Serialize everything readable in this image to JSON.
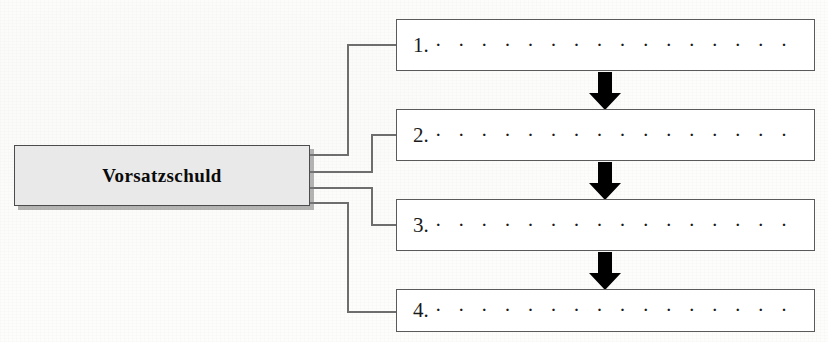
{
  "page": {
    "cropped_header_remnant": "g",
    "width": 828,
    "height": 342,
    "background_color": "#fdfdfc"
  },
  "diagram": {
    "type": "flowchart",
    "orientation": "left-to-right with vertical sequence",
    "source_node": {
      "label": "Vorsatzschuld",
      "fill_color": "#e9e9e9",
      "border_color": "#4c4c4c",
      "text_color": "#0a0a0a",
      "has_drop_shadow": true
    },
    "items": [
      {
        "number": "1.",
        "dots": "· · · · · · · · · · · · · · · · · · · · · · · · · · · · · · ·",
        "text": ""
      },
      {
        "number": "2.",
        "dots": "· · · · · · · · · · · · · · · · · · · · · · · · · · · · · · ·",
        "text": ""
      },
      {
        "number": "3.",
        "dots": "· · · · · · · · · · · · · · · · · · · · · · · · · · · · · · ·",
        "text": ""
      },
      {
        "number": "4.",
        "dots": "· · · · · · · · · · · · · · · · · · · · · · · · · · · · · · ·",
        "text": ""
      }
    ],
    "arrows": [
      {
        "name": "arrow-1-to-2",
        "direction": "down",
        "color": "#000000"
      },
      {
        "name": "arrow-2-to-3",
        "direction": "down",
        "color": "#000000"
      },
      {
        "name": "arrow-3-to-4",
        "direction": "down",
        "color": "#000000"
      }
    ],
    "connectors": {
      "count": 4,
      "style": "orthogonal elbow",
      "color": "#6e6e6e"
    }
  }
}
